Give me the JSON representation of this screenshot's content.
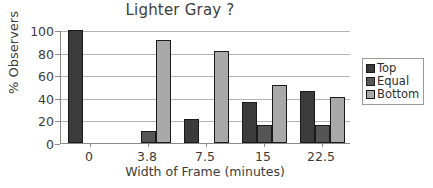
{
  "chart_data": {
    "type": "bar",
    "title": "Lighter Gray ?",
    "xlabel": "Width of Frame (minutes)",
    "ylabel": "% Observers",
    "categories": [
      "0",
      "3.8",
      "7.5",
      "15",
      "22.5"
    ],
    "series": [
      {
        "name": "Top",
        "color": "#3b3b3b",
        "values": [
          100,
          0,
          21,
          36,
          46
        ]
      },
      {
        "name": "Equal",
        "color": "#555555",
        "values": [
          0,
          11,
          0,
          16,
          16
        ]
      },
      {
        "name": "Bottom",
        "color": "#a9a9a9",
        "values": [
          0,
          91,
          81,
          51,
          41
        ]
      }
    ],
    "ylim": [
      0,
      100
    ],
    "yticks": [
      "0",
      "20",
      "40",
      "60",
      "80",
      "100"
    ],
    "grid": true,
    "legend_position": "right",
    "legend_entries": [
      "Top",
      "Equal",
      "Bottom"
    ]
  }
}
